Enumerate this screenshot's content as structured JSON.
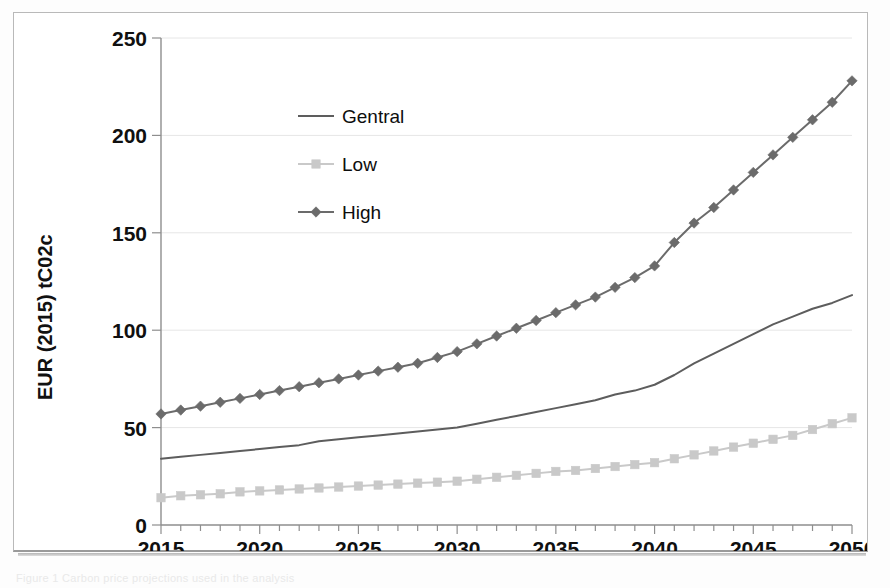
{
  "figure": {
    "caption": "Figure 1  Carbon price projections used in the analysis",
    "background_color": "#ffffff"
  },
  "chart_data": {
    "type": "line",
    "title": "",
    "xlabel": "",
    "ylabel": "EUR (2015) tC02c",
    "xlim": [
      2015,
      2050
    ],
    "ylim": [
      0,
      250
    ],
    "grid": true,
    "grid_axis": "y",
    "legend_position": "upper-left-inside",
    "y_ticks": [
      0,
      50,
      100,
      150,
      200,
      250
    ],
    "y_tick_labels": [
      "0",
      "50",
      "100",
      "150",
      "200",
      "250"
    ],
    "x_ticks": [
      2015,
      2020,
      2025,
      2030,
      2035,
      2040,
      2045,
      2050
    ],
    "x_tick_labels": [
      "2015",
      "2020",
      "2025",
      "2030",
      "2035",
      "2040",
      "2045",
      "2050"
    ],
    "x_minor_tick_interval": 1,
    "x": [
      2015,
      2016,
      2017,
      2018,
      2019,
      2020,
      2021,
      2022,
      2023,
      2024,
      2025,
      2026,
      2027,
      2028,
      2029,
      2030,
      2031,
      2032,
      2033,
      2034,
      2035,
      2036,
      2037,
      2038,
      2039,
      2040,
      2041,
      2042,
      2043,
      2044,
      2045,
      2046,
      2047,
      2048,
      2049,
      2050
    ],
    "series": [
      {
        "name": "Gentral",
        "color": "#5d5d5d",
        "marker": "none",
        "line_width": 2,
        "values": [
          34,
          35,
          36,
          37,
          38,
          39,
          40,
          41,
          43,
          44,
          45,
          46,
          47,
          48,
          49,
          50,
          52,
          54,
          56,
          58,
          60,
          62,
          64,
          67,
          69,
          72,
          77,
          83,
          88,
          93,
          98,
          103,
          107,
          111,
          114,
          118
        ]
      },
      {
        "name": "Low",
        "color": "#c9c9c9",
        "marker": "square",
        "line_width": 2,
        "values": [
          14,
          15,
          15.5,
          16,
          17,
          17.5,
          18,
          18.5,
          19,
          19.5,
          20,
          20.5,
          21,
          21.5,
          22,
          22.5,
          23.5,
          24.5,
          25.5,
          26.5,
          27.5,
          28,
          29,
          30,
          31,
          32,
          34,
          36,
          38,
          40,
          42,
          44,
          46,
          49,
          52,
          55
        ]
      },
      {
        "name": "High",
        "color": "#6b6b6b",
        "marker": "diamond",
        "line_width": 2,
        "values": [
          57,
          59,
          61,
          63,
          65,
          67,
          69,
          71,
          73,
          75,
          77,
          79,
          81,
          83,
          86,
          89,
          93,
          97,
          101,
          105,
          109,
          113,
          117,
          122,
          127,
          133,
          145,
          155,
          163,
          172,
          181,
          190,
          199,
          208,
          217,
          228
        ]
      }
    ]
  },
  "legend": {
    "items": [
      {
        "label": "Gentral",
        "color": "#5d5d5d",
        "marker": "none"
      },
      {
        "label": "Low",
        "color": "#c9c9c9",
        "marker": "square"
      },
      {
        "label": "High",
        "color": "#6b6b6b",
        "marker": "diamond"
      }
    ]
  }
}
